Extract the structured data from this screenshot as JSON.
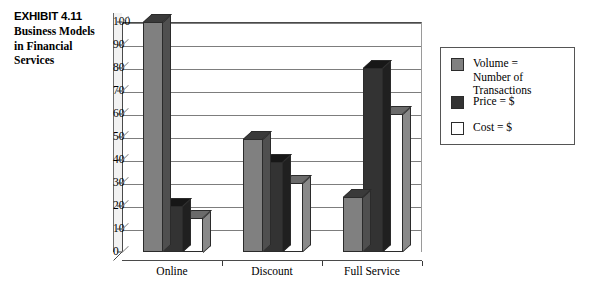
{
  "caption": {
    "number": "EXHIBIT 4.11",
    "title": "Business\nModels in\nFinancial\nServices"
  },
  "legend": {
    "entries": [
      {
        "label": "Volume =\nNumber of Transactions",
        "color": "#808080",
        "name": "volume"
      },
      {
        "label": "Price = $",
        "color": "#333333",
        "name": "price"
      },
      {
        "label": "Cost = $",
        "color": "#ffffff",
        "name": "cost"
      }
    ]
  },
  "chart_data": {
    "type": "bar",
    "title": "Business Models in Financial Services",
    "xlabel": "",
    "ylabel": "",
    "ylim": [
      0,
      100
    ],
    "ytick_step": 10,
    "yticks": [
      0,
      10,
      20,
      30,
      40,
      50,
      60,
      70,
      80,
      90,
      100
    ],
    "grid": true,
    "legend_position": "right",
    "three_d": true,
    "categories": [
      "Online",
      "Discount",
      "Full Service"
    ],
    "series": [
      {
        "name": "Volume = Number of Transactions",
        "color": "#808080",
        "values": [
          100,
          49,
          24
        ]
      },
      {
        "name": "Price = $",
        "color": "#333333",
        "values": [
          20,
          39,
          80
        ]
      },
      {
        "name": "Cost = $",
        "color": "#ffffff",
        "values": [
          15,
          30,
          60
        ]
      }
    ]
  }
}
